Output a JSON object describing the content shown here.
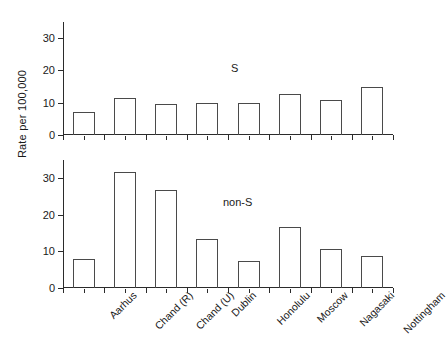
{
  "chart_data": {
    "type": "bar",
    "title": "",
    "xlabel": "",
    "ylabel": "Rate per 100,000",
    "categories": [
      "Aarhus",
      "Chand (R)",
      "Chand (U)",
      "Dublin",
      "Honolulu",
      "Moscow",
      "Nagasaki",
      "Nottingham"
    ],
    "panels": [
      {
        "name": "S",
        "annotation": "S",
        "ylim": [
          0,
          35
        ],
        "yticks": [
          0,
          10,
          20,
          30
        ],
        "ytick_labels": [
          "0",
          "10",
          "20",
          "30"
        ],
        "grid": false,
        "values": [
          7.0,
          11.5,
          9.7,
          9.8,
          9.8,
          12.7,
          10.8,
          15.0
        ]
      },
      {
        "name": "non-S",
        "annotation": "non-S",
        "ylim": [
          0,
          35
        ],
        "yticks": [
          0,
          10,
          20,
          30
        ],
        "ytick_labels": [
          "0",
          "10",
          "20",
          "30"
        ],
        "grid": false,
        "values": [
          8.0,
          31.8,
          26.8,
          13.5,
          7.3,
          16.7,
          10.7,
          8.8
        ]
      }
    ],
    "legend": "none",
    "series": [
      {
        "name": "S",
        "values": [
          7.0,
          11.5,
          9.7,
          9.8,
          9.8,
          12.7,
          10.8,
          15.0
        ]
      },
      {
        "name": "non-S",
        "values": [
          8.0,
          31.8,
          26.8,
          13.5,
          7.3,
          16.7,
          10.7,
          8.8
        ]
      }
    ]
  }
}
